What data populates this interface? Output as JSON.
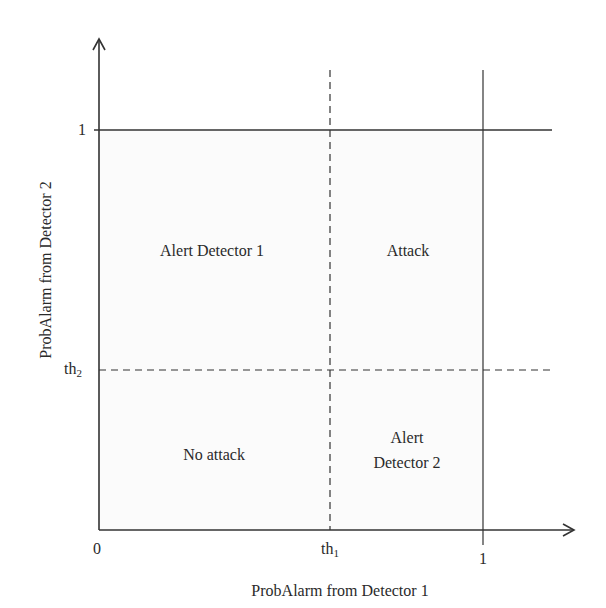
{
  "diagram": {
    "type": "decision-region-plot",
    "x_axis": {
      "label": "ProbAlarm from Detector 1",
      "ticks": {
        "zero": "0",
        "th1": "th",
        "th1_sub": "1",
        "one": "1"
      }
    },
    "y_axis": {
      "label": "ProbAlarm from Detector 2",
      "ticks": {
        "th2": "th",
        "th2_sub": "2",
        "one": "1"
      }
    },
    "regions": {
      "top_left": "Alert Detector 1",
      "top_right": "Attack",
      "bottom_left": "No attack",
      "bottom_right_line1": "Alert",
      "bottom_right_line2": "Detector 2"
    },
    "colors": {
      "line": "#333333",
      "text": "#2a2a2a",
      "background": "#ffffff"
    }
  }
}
